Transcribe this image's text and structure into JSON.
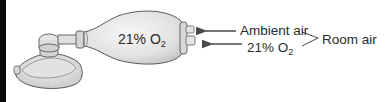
{
  "diagram": {
    "bag_label": {
      "text": "21% O",
      "subscript": "2"
    },
    "labels": {
      "ambient_air": "Ambient air",
      "oxygen_percent": {
        "text": "21% O",
        "subscript": "2"
      },
      "room_air": "Room air"
    },
    "components": [
      "face-mask",
      "valve-connector",
      "self-inflating-bag",
      "intake-valve"
    ],
    "colors": {
      "bag_fill": "#e6e6e6",
      "outline": "#5a5a5a",
      "text": "#2a2a2a",
      "left_bar": "#0a0a0a"
    }
  }
}
